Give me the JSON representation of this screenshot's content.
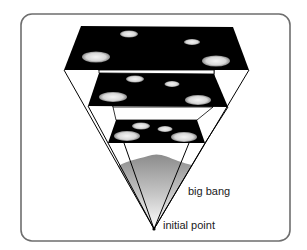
{
  "diagram": {
    "labels": {
      "big_bang": "big bang",
      "initial_point": "initial point"
    },
    "colors": {
      "panel": "#000000",
      "frame_stroke": "#6e6e6e",
      "gradient_top": "#8c8c8c",
      "gradient_bottom": "#ffffff",
      "galaxy": "#e6e6e6"
    },
    "frame": {
      "x": 21,
      "y": 14,
      "width": 269,
      "height": 227,
      "radius": 11
    },
    "apex": [
      154,
      229
    ],
    "panels": [
      {
        "name": "top",
        "corners": [
          [
            81,
            26
          ],
          [
            233,
            27
          ],
          [
            249,
            70
          ],
          [
            64,
            70
          ]
        ],
        "galaxies": [
          {
            "cx": 129,
            "cy": 34,
            "rx": 9,
            "ry": 3.5
          },
          {
            "cx": 192,
            "cy": 42,
            "rx": 8,
            "ry": 3
          },
          {
            "cx": 96,
            "cy": 57,
            "rx": 14,
            "ry": 5.5
          },
          {
            "cx": 216,
            "cy": 61,
            "rx": 14,
            "ry": 5.5
          }
        ]
      },
      {
        "name": "middle",
        "corners": [
          [
            99,
            73
          ],
          [
            214,
            74
          ],
          [
            228,
            107
          ],
          [
            88,
            106
          ]
        ],
        "galaxies": [
          {
            "cx": 135,
            "cy": 79,
            "rx": 9,
            "ry": 3.5
          },
          {
            "cx": 172,
            "cy": 84,
            "rx": 7.5,
            "ry": 3
          },
          {
            "cx": 113,
            "cy": 97,
            "rx": 14,
            "ry": 5
          },
          {
            "cx": 198,
            "cy": 100,
            "rx": 13,
            "ry": 5
          }
        ]
      },
      {
        "name": "bottom",
        "corners": [
          [
            116,
            120
          ],
          [
            197,
            120
          ],
          [
            205,
            143
          ],
          [
            108,
            143
          ]
        ],
        "galaxies": [
          {
            "cx": 141,
            "cy": 126,
            "rx": 9,
            "ry": 3.5
          },
          {
            "cx": 165,
            "cy": 129,
            "rx": 7.5,
            "ry": 3
          },
          {
            "cx": 127,
            "cy": 136,
            "rx": 13,
            "ry": 5
          },
          {
            "cx": 184,
            "cy": 137,
            "rx": 13,
            "ry": 5
          }
        ]
      }
    ],
    "strips": [
      {
        "corners": [
          [
            99,
            70
          ],
          [
            214,
            70
          ],
          [
            214,
            74
          ],
          [
            99,
            73
          ]
        ]
      },
      {
        "corners": [
          [
            113,
            107
          ],
          [
            213,
            107
          ],
          [
            197,
            120
          ],
          [
            116,
            120
          ]
        ]
      }
    ],
    "cone_lines": [
      [
        [
          64,
          70
        ],
        [
          154,
          229
        ]
      ],
      [
        [
          249,
          70
        ],
        [
          154,
          229
        ]
      ],
      [
        [
          88,
          106
        ],
        [
          108,
          143
        ]
      ],
      [
        [
          228,
          107
        ],
        [
          205,
          143
        ]
      ],
      [
        [
          99,
          70
        ],
        [
          113,
          107
        ]
      ],
      [
        [
          214,
          70
        ],
        [
          213,
          107
        ]
      ],
      [
        [
          108,
          143
        ],
        [
          154,
          229
        ]
      ],
      [
        [
          205,
          143
        ],
        [
          154,
          229
        ]
      ],
      [
        [
          124,
          143
        ],
        [
          154,
          229
        ]
      ],
      [
        [
          189,
          143
        ],
        [
          154,
          229
        ]
      ]
    ],
    "glow": {
      "path": "M118,166 C128,160 142,158 152,155 C160,153 168,157 178,161 C184,163 188,164 192,165 L154,229 Z"
    }
  }
}
